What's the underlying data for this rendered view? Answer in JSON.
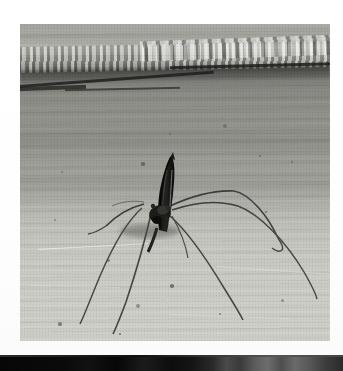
{
  "page": {
    "kind": "scanned-photograph",
    "width": 343,
    "height": 371,
    "background_color": "#ffffff"
  },
  "photo": {
    "name": "mosquito-photograph",
    "alt_text": "Black and white photograph of a crane fly / mosquito standing on a pale concrete surface",
    "frame": {
      "left": 20,
      "top": 24,
      "width": 310,
      "height": 317
    },
    "border_color": "#ffffff",
    "palette": {
      "floor_light": "#cfcfc9",
      "wall_mid": "#93938d",
      "wall_dark": "#6e6e69",
      "crack_dark": "#1e1e1e",
      "insect_body": "#181818",
      "insect_leg": "#3a3a38",
      "highlight": "#d8d8d2"
    },
    "regions": [
      {
        "name": "upper-wall-band",
        "description": "Rough textured mortar band with chipped light speckles",
        "y_range": [
          0,
          46
        ]
      },
      {
        "name": "crack-line",
        "description": "Dark horizontal crack running left to right with a slight upward slope",
        "y_range": [
          40,
          70
        ]
      },
      {
        "name": "mid-wall-band",
        "description": "Horizontally streaked mid-gray concrete",
        "y_range": [
          70,
          180
        ]
      },
      {
        "name": "foreground-floor",
        "description": "Pale smooth concrete floor with small dark specks",
        "y_range": [
          180,
          317
        ]
      }
    ],
    "subject": {
      "name": "crane-fly",
      "body_x": 143,
      "body_y": 150,
      "body_angle_deg": 12,
      "leg_count": 6,
      "description": "Dark slender insect standing upright with long thin legs splayed outward, casting faint contact shadows"
    },
    "specks": [
      {
        "x": 205,
        "y": 102,
        "r": 2.4
      },
      {
        "x": 150,
        "y": 110,
        "r": 1.2
      },
      {
        "x": 123,
        "y": 140,
        "r": 1.6
      },
      {
        "x": 42,
        "y": 148,
        "r": 1.4
      },
      {
        "x": 272,
        "y": 138,
        "r": 1.3
      },
      {
        "x": 240,
        "y": 132,
        "r": 1.0
      },
      {
        "x": 35,
        "y": 196,
        "r": 1.4
      },
      {
        "x": 88,
        "y": 236,
        "r": 1.5
      },
      {
        "x": 152,
        "y": 262,
        "r": 1.8
      },
      {
        "x": 118,
        "y": 282,
        "r": 2.0
      },
      {
        "x": 40,
        "y": 300,
        "r": 1.6
      },
      {
        "x": 246,
        "y": 188,
        "r": 1.3
      },
      {
        "x": 262,
        "y": 276,
        "r": 1.5
      },
      {
        "x": 200,
        "y": 290,
        "r": 1.2
      },
      {
        "x": 100,
        "y": 310,
        "r": 1.4
      }
    ]
  },
  "bottom_strip": {
    "name": "adjacent-photo-edge",
    "description": "Sliver of a second, mostly black photograph at the very bottom of the scan",
    "top": 355,
    "height": 16,
    "color": "#0b0b0b"
  }
}
